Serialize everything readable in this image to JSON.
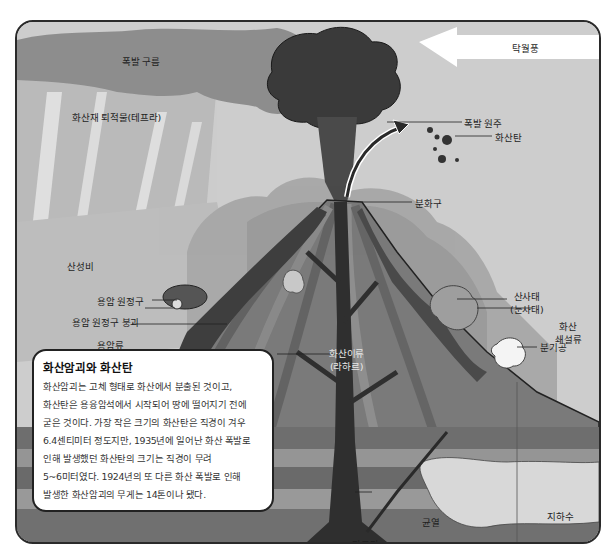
{
  "diagram": {
    "type": "volcano-cross-section",
    "colors": {
      "sky": "#cfcfcf",
      "explosion_cloud": "#8e8e8e",
      "eruption_column": "#3a3a3a",
      "volcano_body": "#7a7a7a",
      "ground_layers_dark": "#6b6b6b",
      "ground_layers_light": "#9a9a9a",
      "groundwater": "#d8d8d8",
      "magma_conduit": "#2f2f2f",
      "wind_arrow": "#ffffff"
    },
    "labels": {
      "explosion_cloud": "폭발 구름",
      "tephra": "화산재 퇴적물(테프라)",
      "wind": "탁월풍",
      "eruption_column": "폭발 원주",
      "volcanic_bomb": "화산탄",
      "crater": "분화구",
      "acid_rain": "산성비",
      "lava_dome": "용암 원정구",
      "lava_dome_collapse": "용암 원정구 붕괴",
      "lava_flow": "용암류",
      "lahar_line1": "화산이류",
      "lahar_line2": "(라하르)",
      "landslide_line1": "산사태",
      "landslide_line2": "(눈사태)",
      "pyroclastic_line1": "화산",
      "pyroclastic_line2": "쇄설류",
      "fumarole": "분기공",
      "fissure": "균열",
      "groundwater": "지하수",
      "magma": "마그마"
    }
  },
  "infobox": {
    "title": "화산암괴와 화산탄",
    "body": "화산암괴는 고체 형태로 화산에서 분출된 것이고, 화산탄은 용융암석에서 시작되어 땅에 떨어지기 전에 굳은 것이다. 가장 작은 크기의 화산탄은 직경이 겨우 6.4센티미터 정도지만, 1935년에 일어난 화산 폭발로 인해 발생했던 화산탄의 크기는 직경이 무려 5~6미터였다. 1924년의 또 다른 화산 폭발로 인해 발생한 화산암괴의 무게는 14톤이나 됐다."
  }
}
